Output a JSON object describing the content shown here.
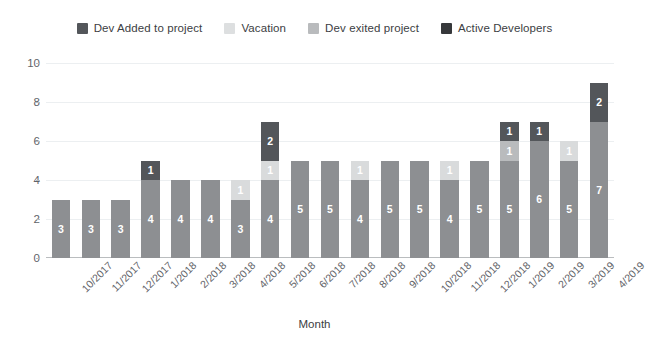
{
  "chart_data": {
    "type": "bar",
    "stacked": true,
    "title": "",
    "xlabel": "Month",
    "ylabel": "",
    "ylim": [
      0,
      10
    ],
    "yticks": [
      0,
      2,
      4,
      6,
      8,
      10
    ],
    "grid": true,
    "legend_position": "top",
    "categories": [
      "10/2017",
      "11/2017",
      "12/2017",
      "1/2018",
      "2/2018",
      "3/2018",
      "4/2018",
      "5/2018",
      "6/2018",
      "7/2018",
      "8/2018",
      "9/2018",
      "10/2018",
      "11/2018",
      "12/2018",
      "1/2019",
      "2/2019",
      "3/2019",
      "4/2019"
    ],
    "series": [
      {
        "name": "Active Developers",
        "color": "#8d8f92",
        "values": [
          3,
          3,
          3,
          4,
          4,
          4,
          3,
          4,
          5,
          5,
          4,
          5,
          5,
          4,
          5,
          5,
          6,
          5,
          7
        ]
      },
      {
        "name": "Dev exited project",
        "color": "#b9bbbd",
        "values": [
          0,
          0,
          0,
          0,
          0,
          0,
          0,
          0,
          0,
          0,
          0,
          0,
          0,
          0,
          0,
          1,
          0,
          0,
          0
        ]
      },
      {
        "name": "Vacation",
        "color": "#d9dbdc",
        "values": [
          0,
          0,
          0,
          0,
          0,
          0,
          1,
          1,
          0,
          0,
          1,
          0,
          0,
          1,
          0,
          0,
          0,
          1,
          0
        ]
      },
      {
        "name": "Dev Added to project",
        "color": "#53565a",
        "values": [
          0,
          0,
          0,
          1,
          0,
          0,
          0,
          2,
          0,
          0,
          0,
          0,
          0,
          0,
          0,
          1,
          1,
          0,
          2
        ]
      }
    ],
    "totals": [
      3,
      3,
      3,
      5,
      4,
      4,
      4,
      7,
      5,
      5,
      5,
      5,
      5,
      5,
      5,
      7,
      7,
      6,
      9
    ]
  },
  "legend": {
    "items": [
      {
        "label": "Dev Added to project",
        "color": "#53565a"
      },
      {
        "label": "Vacation",
        "color": "#dddfe0"
      },
      {
        "label": "Dev exited project",
        "color": "#b9bbbd"
      },
      {
        "label": "Active Developers",
        "color": "#36383b"
      }
    ]
  },
  "axis": {
    "x_title": "Month",
    "y_ticks": [
      "0",
      "2",
      "4",
      "6",
      "8",
      "10"
    ]
  },
  "colors": {
    "background": "#ffffff",
    "gridline": "#eceff1",
    "axis_line": "#babdbf",
    "tick_text": "#5f6368",
    "label_text": "#ffffff"
  }
}
